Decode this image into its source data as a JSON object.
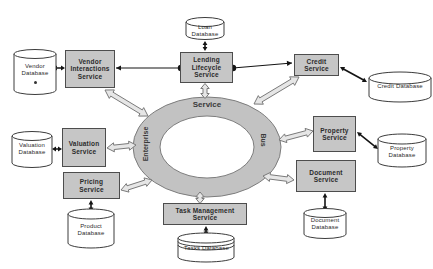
{
  "colors": {
    "background": "#ffffff",
    "service_box_fill": "#c6c6c6",
    "service_box_border": "#4d4d4d",
    "ring_fill": "#c2c2c2",
    "ring_border": "#7d7d7d",
    "hollow_arrow_fill": "#e6e6e6",
    "connector_color": "#141414",
    "database_fill": "#ffffff"
  },
  "ring": {
    "left_label": "Enterprise",
    "top_label": "Service",
    "right_label": "Bus"
  },
  "services": [
    {
      "id": "vendor-interactions",
      "label": "Vendor Interactions Service"
    },
    {
      "id": "lending-lifecycle",
      "label": "Lending Lifecycle Service"
    },
    {
      "id": "credit",
      "label": "Credit Service"
    },
    {
      "id": "valuation",
      "label": "Valuation Service"
    },
    {
      "id": "pricing",
      "label": "Pricing Service"
    },
    {
      "id": "task-management",
      "label": "Task Management Service"
    },
    {
      "id": "property",
      "label": "Property Service"
    },
    {
      "id": "document",
      "label": "Document Service"
    }
  ],
  "databases": [
    {
      "id": "vendor",
      "label": "Vendor Database"
    },
    {
      "id": "loan",
      "label": "Loan Database"
    },
    {
      "id": "credit",
      "label": "Credit Database"
    },
    {
      "id": "valuation",
      "label": "Valuation Database"
    },
    {
      "id": "product",
      "label": "Product Database"
    },
    {
      "id": "tasks",
      "label": "Tasks Database"
    },
    {
      "id": "property",
      "label": "Property Database"
    },
    {
      "id": "document",
      "label": "Document Database"
    }
  ]
}
